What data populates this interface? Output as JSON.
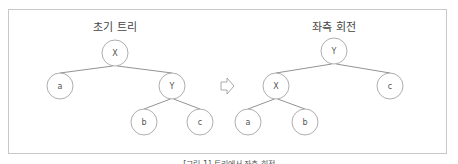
{
  "left_panel": {
    "title": "초기 트리",
    "nodes": [
      {
        "id": "X",
        "label": "X",
        "cx": 115,
        "cy": 53
      },
      {
        "id": "a",
        "label": "a",
        "cx": 60,
        "cy": 86
      },
      {
        "id": "Y",
        "label": "Y",
        "cx": 172,
        "cy": 86
      },
      {
        "id": "b",
        "label": "b",
        "cx": 144,
        "cy": 122
      },
      {
        "id": "c",
        "label": "c",
        "cx": 200,
        "cy": 122
      }
    ],
    "edges": [
      [
        "X",
        "a"
      ],
      [
        "X",
        "Y"
      ],
      [
        "Y",
        "b"
      ],
      [
        "Y",
        "c"
      ]
    ]
  },
  "right_panel": {
    "title": "좌측 회전",
    "nodes": [
      {
        "id": "Y",
        "label": "Y",
        "cx": 334,
        "cy": 51
      },
      {
        "id": "X",
        "label": "X",
        "cx": 276,
        "cy": 86
      },
      {
        "id": "c",
        "label": "c",
        "cx": 390,
        "cy": 86
      },
      {
        "id": "a",
        "label": "a",
        "cx": 248,
        "cy": 122
      },
      {
        "id": "b",
        "label": "b",
        "cx": 305,
        "cy": 122
      }
    ],
    "edges": [
      [
        "Y",
        "X"
      ],
      [
        "Y",
        "c"
      ],
      [
        "X",
        "a"
      ],
      [
        "X",
        "b"
      ]
    ]
  },
  "arrow": {
    "icon": "right-arrow-outline",
    "x": 221,
    "y": 86
  },
  "caption": "[그림 1] 트리에서 좌측 회전",
  "colors": {
    "stroke": "#999999",
    "line": "#777777",
    "text": "#555555",
    "border": "#c8c8c8"
  }
}
